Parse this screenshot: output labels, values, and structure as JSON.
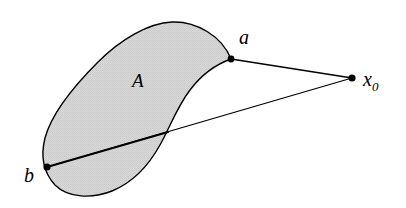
{
  "figure": {
    "kind": "set-diagram",
    "background_color": "#ffffff",
    "region": {
      "name": "A",
      "label": "A",
      "label_position": {
        "x": 132,
        "y": 87
      },
      "fill_color": "#d4d4d4",
      "stroke_color": "#000000",
      "stroke_width": 1.4,
      "outline_path": "M 231 59 C 222 36, 196 21, 172 22 C 148 23, 120 40, 98 62 C 74 86, 52 112, 45 138 C 40 158, 44 173, 55 185 C 68 198, 92 199, 112 191 C 134 182, 150 163, 160 145 C 170 127, 177 107, 190 90 C 202 74, 217 64, 231 59 Z"
    },
    "points": [
      {
        "id": "a",
        "label": "a",
        "x": 231,
        "y": 59,
        "radius": 3.4,
        "color": "#000000",
        "label_x": 239,
        "label_y": 44
      },
      {
        "id": "b",
        "label": "b",
        "x": 47,
        "y": 167,
        "radius": 3.6,
        "color": "#000000",
        "label_x": 24,
        "label_y": 182
      },
      {
        "id": "x0",
        "label": "x",
        "subscript": "0",
        "x": 352,
        "y": 78,
        "radius": 3.6,
        "color": "#000000",
        "label_x": 363,
        "label_y": 86
      }
    ],
    "segments": [
      {
        "id": "a-x0",
        "from": "a",
        "to": "x0",
        "x1": 231,
        "y1": 59,
        "x2": 352,
        "y2": 78,
        "stroke_color": "#000000",
        "stroke_width": 1.3
      },
      {
        "id": "b-x0",
        "from": "b",
        "to": "x0",
        "x1": 47,
        "y1": 167,
        "x2": 352,
        "y2": 78,
        "stroke_color": "#000000",
        "stroke_width": 1.3
      },
      {
        "id": "b-boundary-chord",
        "from": "b",
        "to": "boundary-crossing",
        "x1": 47,
        "y1": 167,
        "x2": 168,
        "y2": 132,
        "stroke_color": "#000000",
        "stroke_width": 2.1
      }
    ]
  }
}
